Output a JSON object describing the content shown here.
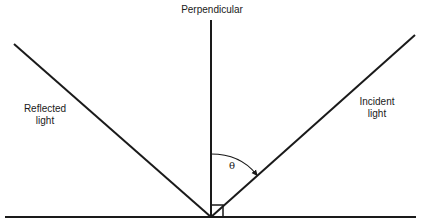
{
  "diagram": {
    "type": "law-of-reflection",
    "colors": {
      "line": "#1a1a1a",
      "background": "#ffffff"
    },
    "labels": {
      "perpendicular": "Perpendicular",
      "reflected": "Reflected\nlight",
      "incident": "Incident\nlight",
      "angle": "θ"
    },
    "geometry": {
      "surface": {
        "x1": 5,
        "y1": 217,
        "x2": 416,
        "y2": 217
      },
      "normal": {
        "x1": 211,
        "y1": 20,
        "x2": 211,
        "y2": 217
      },
      "incident_ray": {
        "x1": 415,
        "y1": 35,
        "x2": 211,
        "y2": 217
      },
      "reflected_ray": {
        "x1": 211,
        "y1": 217,
        "x2": 14,
        "y2": 44
      },
      "right_angle_box": {
        "x": 211,
        "y": 205,
        "size": 12
      }
    }
  }
}
